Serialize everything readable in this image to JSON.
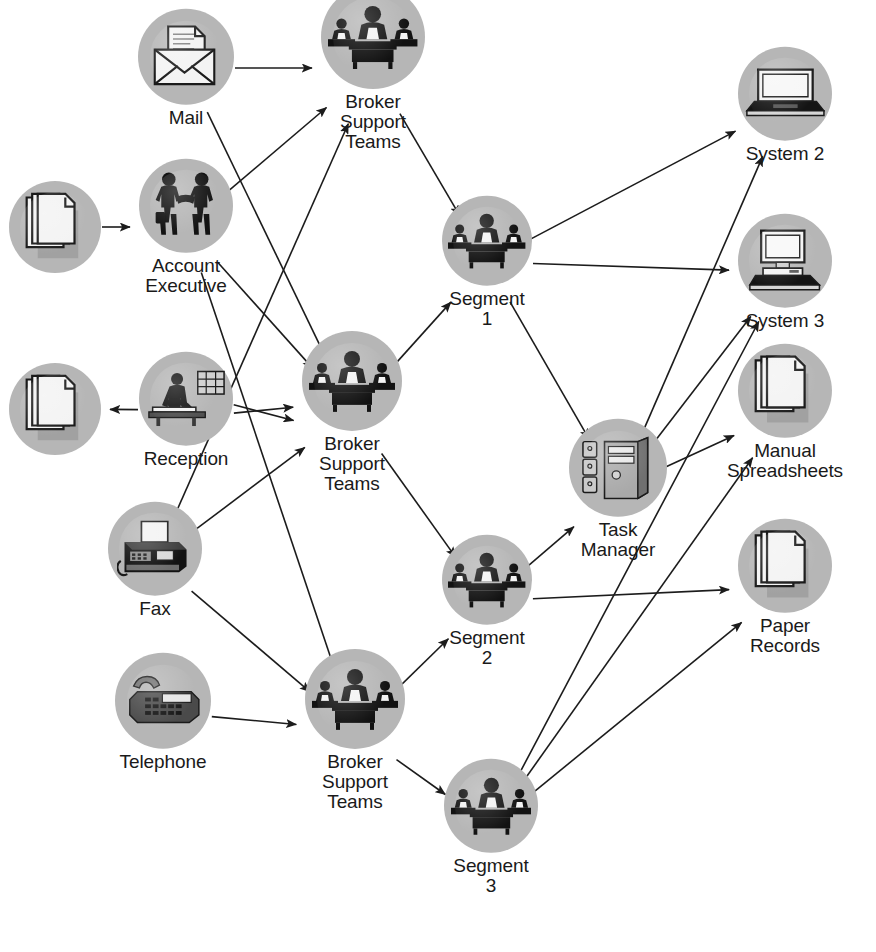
{
  "figure": {
    "cropped_caption_fragment": "Figure  —  process flow: broker support operations"
  },
  "palette": {
    "bubble_fill": "#b6b6b6",
    "bubble_shadow": "#9a9a9a",
    "edge_color": "#1c1c1c",
    "label_color": "#1a1a1a",
    "paper_white": "#f2f2f2",
    "icon_black": "#111111",
    "background": "#ffffff"
  },
  "diagram": {
    "type": "flow-network",
    "width": 876,
    "height": 952,
    "nodes": [
      {
        "id": "docs_in",
        "label": "",
        "icon": "documents-icon",
        "x": 55,
        "y": 409,
        "r": 46
      },
      {
        "id": "mail",
        "label": "Mail",
        "icon": "mail-envelope-icon",
        "x": 186,
        "y": 68,
        "r": 48
      },
      {
        "id": "account_exec",
        "label": "Account\nExecutive",
        "icon": "handshake-icon",
        "x": 186,
        "y": 227,
        "r": 47
      },
      {
        "id": "docs_out",
        "label": "",
        "icon": "documents-icon",
        "x": 55,
        "y": 409,
        "r": 46
      },
      {
        "id": "reception",
        "label": "Reception",
        "icon": "reception-desk-icon",
        "x": 186,
        "y": 410,
        "r": 47
      },
      {
        "id": "fax",
        "label": "Fax",
        "icon": "fax-machine-icon",
        "x": 155,
        "y": 560,
        "r": 47
      },
      {
        "id": "telephone",
        "label": "Telephone",
        "icon": "telephone-icon",
        "x": 163,
        "y": 712,
        "r": 48
      },
      {
        "id": "bst_top",
        "label": "Broker\nSupport\nTeams",
        "icon": "meeting-team-icon",
        "x": 373,
        "y": 68,
        "r": 52
      },
      {
        "id": "bst_mid",
        "label": "Broker\nSupport\nTeams",
        "icon": "meeting-team-icon",
        "x": 352,
        "y": 412,
        "r": 50
      },
      {
        "id": "bst_bottom",
        "label": "Broker\nSupport\nTeams",
        "icon": "meeting-team-icon",
        "x": 355,
        "y": 730,
        "r": 50
      },
      {
        "id": "segment1",
        "label": "Segment\n1",
        "icon": "meeting-team-icon",
        "x": 487,
        "y": 262,
        "r": 45
      },
      {
        "id": "segment2",
        "label": "Segment\n2",
        "icon": "meeting-team-icon",
        "x": 487,
        "y": 601,
        "r": 45
      },
      {
        "id": "segment3",
        "label": "Segment\n3",
        "icon": "meeting-team-icon",
        "x": 491,
        "y": 827,
        "r": 47
      },
      {
        "id": "task_manager",
        "label": "Task\nManager",
        "icon": "server-tower-icon",
        "x": 618,
        "y": 489,
        "r": 49
      },
      {
        "id": "system2",
        "label": "System 2",
        "icon": "laptop-icon",
        "x": 785,
        "y": 105,
        "r": 47
      },
      {
        "id": "system3",
        "label": "System 3",
        "icon": "desktop-pc-icon",
        "x": 785,
        "y": 272,
        "r": 47
      },
      {
        "id": "spreadsheets",
        "label": "Manual\nSpreadsheets",
        "icon": "documents-icon",
        "x": 785,
        "y": 412,
        "r": 47
      },
      {
        "id": "paper_records",
        "label": "Paper\nRecords",
        "icon": "documents-icon",
        "x": 785,
        "y": 587,
        "r": 47
      }
    ],
    "edges": [
      {
        "from": "docs_in",
        "to": "account_exec",
        "kind": "arrow"
      },
      {
        "from": "mail",
        "to": "bst_top",
        "kind": "arrow"
      },
      {
        "from": "mail",
        "to": "bst_mid",
        "kind": "arrow"
      },
      {
        "from": "account_exec",
        "to": "bst_top",
        "kind": "arrow"
      },
      {
        "from": "account_exec",
        "to": "bst_mid",
        "kind": "arrow"
      },
      {
        "from": "account_exec",
        "to": "bst_bottom",
        "kind": "arrow"
      },
      {
        "from": "reception",
        "to": "docs_out",
        "kind": "arrow"
      },
      {
        "from": "reception",
        "to": "bst_mid",
        "kind": "arrow"
      },
      {
        "from": "reception",
        "to": "bst_mid_2",
        "kind": "arrow"
      },
      {
        "from": "fax",
        "to": "bst_top",
        "kind": "arrow"
      },
      {
        "from": "fax",
        "to": "bst_mid",
        "kind": "arrow"
      },
      {
        "from": "fax",
        "to": "bst_bottom",
        "kind": "arrow"
      },
      {
        "from": "telephone",
        "to": "bst_bottom",
        "kind": "arrow"
      },
      {
        "from": "bst_top",
        "to": "segment1",
        "kind": "arrow"
      },
      {
        "from": "bst_mid",
        "to": "segment1",
        "kind": "arrow"
      },
      {
        "from": "bst_mid",
        "to": "segment2",
        "kind": "arrow"
      },
      {
        "from": "bst_bottom",
        "to": "segment2",
        "kind": "arrow"
      },
      {
        "from": "bst_bottom",
        "to": "segment3",
        "kind": "arrow"
      },
      {
        "from": "segment1",
        "to": "system2",
        "kind": "arrow"
      },
      {
        "from": "segment1",
        "to": "system3",
        "kind": "arrow"
      },
      {
        "from": "segment1",
        "to": "task_manager",
        "kind": "arrow"
      },
      {
        "from": "segment2",
        "to": "task_manager",
        "kind": "arrow"
      },
      {
        "from": "segment2",
        "to": "paper_records",
        "kind": "arrow"
      },
      {
        "from": "segment3",
        "to": "system3",
        "kind": "arrow"
      },
      {
        "from": "segment3",
        "to": "spreadsheets",
        "kind": "arrow"
      },
      {
        "from": "segment3",
        "to": "paper_records",
        "kind": "arrow"
      },
      {
        "from": "task_manager",
        "to": "system2",
        "kind": "arrow"
      },
      {
        "from": "task_manager",
        "to": "system3",
        "kind": "arrow"
      },
      {
        "from": "task_manager",
        "to": "spreadsheets",
        "kind": "arrow"
      }
    ]
  },
  "labels": {
    "docs_in": "",
    "mail": "Mail",
    "account_exec": "Account\nExecutive",
    "docs_out": "",
    "reception": "Reception",
    "fax": "Fax",
    "telephone": "Telephone",
    "bst_top": "Broker\nSupport\nTeams",
    "bst_mid": "Broker\nSupport\nTeams",
    "bst_bottom": "Broker\nSupport\nTeams",
    "segment1": "Segment\n1",
    "segment2": "Segment\n2",
    "segment3": "Segment\n3",
    "task_manager": "Task\nManager",
    "system2": "System 2",
    "system3": "System 3",
    "spreadsheets": "Manual\nSpreadsheets",
    "paper_records": "Paper\nRecords"
  }
}
